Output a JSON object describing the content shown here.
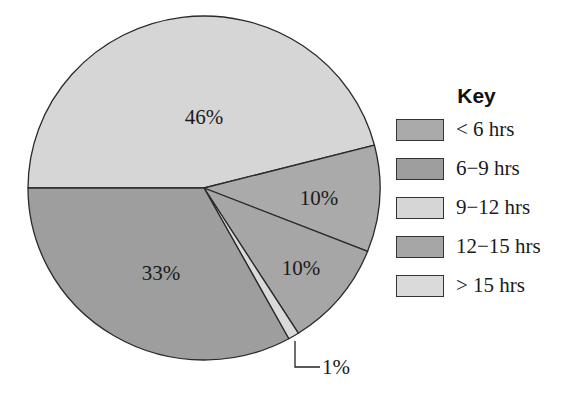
{
  "chart_data": {
    "type": "pie",
    "title": "",
    "legend_title": "Key",
    "legend_position": "right",
    "categories": [
      "< 6 hrs",
      "6−9 hrs",
      "9−12 hrs",
      "12−15 hrs",
      "> 15 hrs"
    ],
    "values": [
      10,
      33,
      46,
      10,
      1
    ],
    "unit": "%",
    "slices": [
      {
        "category": "9−12 hrs",
        "value": 46,
        "label": "46%",
        "color": "#d6d6d6"
      },
      {
        "category": "< 6 hrs",
        "value": 10,
        "label": "10%",
        "color": "#aaaaaa"
      },
      {
        "category": "12−15 hrs",
        "value": 10,
        "label": "10%",
        "color": "#a6a6a6"
      },
      {
        "category": "> 15 hrs",
        "value": 1,
        "label": "1%",
        "color": "#dadada"
      },
      {
        "category": "6−9 hrs",
        "value": 33,
        "label": "33%",
        "color": "#9e9e9e"
      }
    ],
    "annotations": [
      {
        "text": "1%",
        "type": "leader-line callout",
        "target": "> 15 hrs"
      }
    ]
  },
  "legend": {
    "title": "Key",
    "items": [
      {
        "label": "< 6 hrs",
        "color": "#aaaaaa"
      },
      {
        "label": "6−9 hrs",
        "color": "#9e9e9e"
      },
      {
        "label": "9−12 hrs",
        "color": "#d6d6d6"
      },
      {
        "label": "12−15 hrs",
        "color": "#a6a6a6"
      },
      {
        "label": "> 15 hrs",
        "color": "#dadada"
      }
    ]
  },
  "labels": {
    "s46": "46%",
    "s10a": "10%",
    "s10b": "10%",
    "s33": "33%",
    "s1": "1%"
  }
}
